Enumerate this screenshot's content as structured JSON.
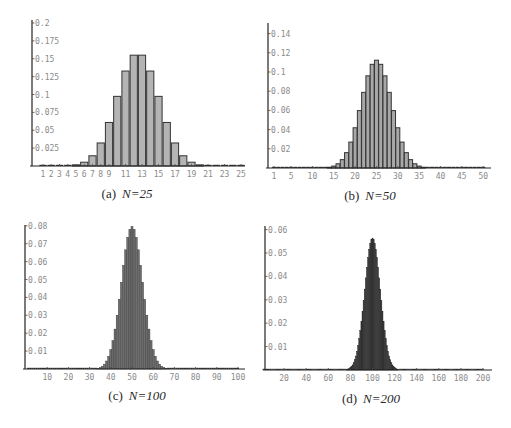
{
  "figure": {
    "panels": [
      {
        "id": "a",
        "caption_prefix": "(a)",
        "caption_var": "N=25"
      },
      {
        "id": "b",
        "caption_prefix": "(b)",
        "caption_var": "N=50"
      },
      {
        "id": "c",
        "caption_prefix": "(c)",
        "caption_var": "N=100"
      },
      {
        "id": "d",
        "caption_prefix": "(d)",
        "caption_var": "N=200"
      }
    ]
  },
  "chart_data": [
    {
      "type": "bar",
      "title": "(a) N=25",
      "description": "Binomial distribution B(25, 0.5)",
      "n": 25,
      "p": 0.5,
      "xlabel": "",
      "ylabel": "",
      "xlim": [
        0,
        26
      ],
      "ylim": [
        0,
        0.2
      ],
      "x_ticks": [
        "1",
        "2",
        "3",
        "4",
        "5",
        "6",
        "7",
        "8",
        "9",
        "11",
        "13",
        "15",
        "17",
        "19",
        "21",
        "23",
        "25"
      ],
      "y_ticks": [
        "0.025",
        "0.05",
        "0.075",
        "0.1",
        "0.125",
        "0.15",
        "0.175",
        "0.2"
      ],
      "bar_color": "#b4b4b4",
      "bar_edge": "#333333",
      "grid": false,
      "categories": [
        1,
        2,
        3,
        4,
        5,
        6,
        7,
        8,
        9,
        10,
        11,
        12,
        13,
        14,
        15,
        16,
        17,
        18,
        19,
        20,
        21,
        22,
        23,
        24,
        25
      ],
      "values": [
        0.0,
        0.0,
        0.0,
        0.0004,
        0.0016,
        0.0053,
        0.0143,
        0.0322,
        0.0609,
        0.0974,
        0.1328,
        0.155,
        0.155,
        0.1328,
        0.0974,
        0.0609,
        0.0322,
        0.0143,
        0.0053,
        0.0016,
        0.0004,
        0.0001,
        0.0,
        0.0,
        0.0
      ]
    },
    {
      "type": "bar",
      "title": "(b) N=50",
      "description": "Binomial distribution B(50, 0.5)",
      "n": 50,
      "p": 0.5,
      "xlabel": "",
      "ylabel": "",
      "xlim": [
        0,
        51
      ],
      "ylim": [
        0,
        0.15
      ],
      "x_ticks": [
        "1",
        "5",
        "10",
        "15",
        "20",
        "25",
        "30",
        "35",
        "40",
        "45",
        "50"
      ],
      "y_ticks": [
        "0.02",
        "0.04",
        "0.06",
        "0.08",
        "0.1",
        "0.12",
        "0.14"
      ],
      "bar_color": "#a8a8a8",
      "bar_edge": "#333333",
      "grid": false,
      "categories": [
        1,
        2,
        3,
        4,
        5,
        6,
        7,
        8,
        9,
        10,
        11,
        12,
        13,
        14,
        15,
        16,
        17,
        18,
        19,
        20,
        21,
        22,
        23,
        24,
        25,
        26,
        27,
        28,
        29,
        30,
        31,
        32,
        33,
        34,
        35,
        36,
        37,
        38,
        39,
        40,
        41,
        42,
        43,
        44,
        45,
        46,
        47,
        48,
        49,
        50
      ],
      "values": [
        0,
        0,
        0,
        0,
        0,
        0,
        0,
        0,
        0,
        0,
        0,
        0.0001,
        0.0003,
        0.0008,
        0.002,
        0.0044,
        0.0087,
        0.016,
        0.027,
        0.0419,
        0.0598,
        0.0788,
        0.096,
        0.108,
        0.1123,
        0.108,
        0.096,
        0.0788,
        0.0598,
        0.0419,
        0.027,
        0.016,
        0.0087,
        0.0044,
        0.002,
        0.0008,
        0.0003,
        0.0001,
        0,
        0,
        0,
        0,
        0,
        0,
        0,
        0,
        0,
        0,
        0,
        0
      ]
    },
    {
      "type": "bar",
      "title": "(c) N=100",
      "description": "Binomial distribution B(100, 0.5)",
      "n": 100,
      "p": 0.5,
      "xlabel": "",
      "ylabel": "",
      "xlim": [
        0,
        102
      ],
      "ylim": [
        0,
        0.08
      ],
      "x_ticks": [
        "10",
        "20",
        "30",
        "40",
        "50",
        "60",
        "70",
        "80",
        "90",
        "100"
      ],
      "y_ticks": [
        "0.01",
        "0.02",
        "0.03",
        "0.04",
        "0.05",
        "0.06",
        "0.07",
        "0.08"
      ],
      "bar_color": "#6e6e6e",
      "bar_edge": "#333333",
      "grid": false,
      "peak": {
        "x": 50,
        "y": 0.0796
      },
      "support_visible": [
        35,
        65
      ]
    },
    {
      "type": "bar",
      "title": "(d) N=200",
      "description": "Binomial distribution B(200, 0.5)",
      "n": 200,
      "p": 0.5,
      "xlabel": "",
      "ylabel": "",
      "xlim": [
        0,
        204
      ],
      "ylim": [
        0,
        0.06
      ],
      "x_ticks": [
        "20",
        "40",
        "60",
        "80",
        "100",
        "120",
        "140",
        "160",
        "180",
        "200"
      ],
      "y_ticks": [
        "0.01",
        "0.02",
        "0.03",
        "0.04",
        "0.05",
        "0.06"
      ],
      "bar_color": "#3c3c3c",
      "bar_edge": "#222222",
      "grid": false,
      "peak": {
        "x": 100,
        "y": 0.0563
      },
      "support_visible": [
        78,
        122
      ]
    }
  ]
}
